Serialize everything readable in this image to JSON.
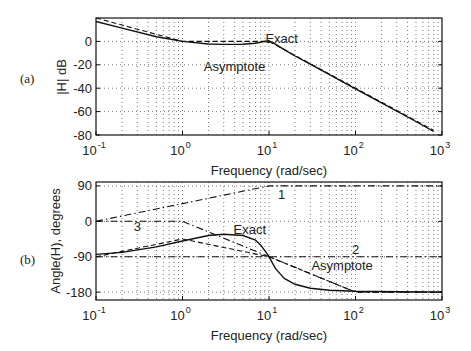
{
  "chart_data": [
    {
      "type": "line",
      "panel_label": "(a)",
      "title": "",
      "xlabel": "Frequency (rad/sec)",
      "ylabel": "|H| dB",
      "xscale": "log",
      "xlim": [
        0.1,
        1000
      ],
      "ylim": [
        -80,
        20
      ],
      "xticks": [
        "10^-1",
        "10^0",
        "10^1",
        "10^2",
        "10^3"
      ],
      "yticks": [
        0,
        -20,
        -40,
        -60,
        -80
      ],
      "grid": true,
      "series": [
        {
          "name": "Exact",
          "style": "solid",
          "x": [
            0.1,
            0.2,
            0.5,
            1,
            2,
            3,
            5,
            7,
            9,
            10,
            12,
            15,
            20,
            30,
            50,
            100,
            200,
            500,
            800
          ],
          "y": [
            17,
            11.4,
            3.9,
            0,
            -2.2,
            -2.6,
            -2.5,
            -1.5,
            0,
            0.5,
            -2.5,
            -7,
            -12.5,
            -19.5,
            -28.5,
            -40.5,
            -52.5,
            -68.5,
            -77
          ]
        },
        {
          "name": "Asymptote",
          "style": "dashed",
          "x": [
            0.1,
            1,
            10,
            800
          ],
          "y": [
            20,
            0,
            0,
            -76
          ]
        }
      ],
      "annotations": [
        {
          "text": "Exact",
          "x": 14,
          "y": 2
        },
        {
          "text": "Asymptote",
          "x": 4,
          "y": -22
        }
      ]
    },
    {
      "type": "line",
      "panel_label": "(b)",
      "title": "",
      "xlabel": "Frequency (rad/sec)",
      "ylabel": "Angle(H), degrees",
      "xscale": "log",
      "xlim": [
        0.1,
        1000
      ],
      "ylim": [
        -200,
        100
      ],
      "xticks": [
        "10^-1",
        "10^0",
        "10^1",
        "10^2",
        "10^3"
      ],
      "yticks": [
        90,
        0,
        -90,
        -180
      ],
      "grid": true,
      "series": [
        {
          "name": "Exact",
          "style": "solid",
          "x": [
            0.1,
            0.2,
            0.5,
            1,
            2,
            3,
            5,
            7,
            8,
            9,
            10,
            11,
            12,
            15,
            20,
            30,
            50,
            100,
            1000
          ],
          "y": [
            -84,
            -79,
            -65,
            -50,
            -36,
            -33,
            -36,
            -48,
            -60,
            -75,
            -90,
            -107,
            -121,
            -145,
            -160,
            -170,
            -175,
            -178,
            -180
          ]
        },
        {
          "name": "Asymptote",
          "style": "dashed",
          "x": [
            0.1,
            1,
            10,
            100,
            1000
          ],
          "y": [
            -90,
            -45,
            -90,
            -180,
            -180
          ]
        },
        {
          "name": "1",
          "style": "dashdot",
          "x": [
            0.1,
            10,
            1000
          ],
          "y": [
            0,
            90,
            90
          ]
        },
        {
          "name": "2",
          "style": "dashdot",
          "x": [
            0.1,
            1000
          ],
          "y": [
            -90,
            -90
          ]
        },
        {
          "name": "3",
          "style": "dashdot",
          "x": [
            0.1,
            1,
            100,
            1000
          ],
          "y": [
            0,
            0,
            -180,
            -180
          ]
        }
      ],
      "annotations": [
        {
          "text": "1",
          "x": 14,
          "y": 67
        },
        {
          "text": "2",
          "x": 100,
          "y": -73
        },
        {
          "text": "3",
          "x": 0.3,
          "y": -15
        },
        {
          "text": "Exact",
          "x": 6,
          "y": -23
        },
        {
          "text": "Asymptote",
          "x": 70,
          "y": -113
        }
      ]
    }
  ],
  "labels": {
    "panel_a": "(a)",
    "panel_b": "(b)",
    "xlabel": "Frequency (rad/sec)",
    "ylabel_a": "|H| dB",
    "ylabel_b": "Angle(H), degrees"
  }
}
